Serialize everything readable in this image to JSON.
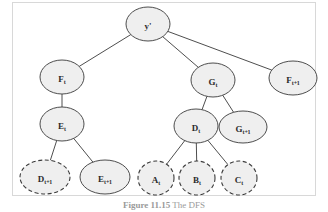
{
  "figure": {
    "caption_label": "Figure",
    "caption_number": "11.15",
    "caption_text": "The DFS",
    "frame_color": "#d8d8d8",
    "node_fill": "#efefef",
    "node_stroke": "#3a3a3a",
    "edge_color": "#3a3a3a"
  },
  "chart_data": {
    "type": "diagram",
    "nodes": [
      {
        "id": "root",
        "main": "y",
        "prime": "'",
        "sub": "",
        "cx": 148,
        "cy": 24,
        "rx": 22,
        "ry": 17,
        "dashed": false
      },
      {
        "id": "Ft",
        "main": "F",
        "prime": "",
        "sub": "t",
        "cx": 62,
        "cy": 77,
        "rx": 22,
        "ry": 17,
        "dashed": false
      },
      {
        "id": "Gt",
        "main": "G",
        "prime": "",
        "sub": "t",
        "cx": 213,
        "cy": 80,
        "rx": 22,
        "ry": 17,
        "dashed": false
      },
      {
        "id": "Ft1",
        "main": "F",
        "prime": "",
        "sub": "t+1",
        "cx": 293,
        "cy": 78,
        "rx": 24,
        "ry": 17,
        "dashed": false
      },
      {
        "id": "Et",
        "main": "E",
        "prime": "",
        "sub": "t",
        "cx": 62,
        "cy": 124,
        "rx": 22,
        "ry": 17,
        "dashed": false
      },
      {
        "id": "Dt",
        "main": "D",
        "prime": "",
        "sub": "t",
        "cx": 196,
        "cy": 126,
        "rx": 22,
        "ry": 17,
        "dashed": false
      },
      {
        "id": "Gt1",
        "main": "G",
        "prime": "",
        "sub": "t+1",
        "cx": 243,
        "cy": 127,
        "rx": 24,
        "ry": 16,
        "dashed": false
      },
      {
        "id": "Dt1",
        "main": "D",
        "prime": "",
        "sub": "t+1",
        "cx": 45,
        "cy": 177,
        "rx": 25,
        "ry": 17,
        "dashed": true
      },
      {
        "id": "Et1",
        "main": "E",
        "prime": "",
        "sub": "t+1",
        "cx": 105,
        "cy": 177,
        "rx": 25,
        "ry": 17,
        "dashed": false
      },
      {
        "id": "At",
        "main": "A",
        "prime": "",
        "sub": "t",
        "cx": 156,
        "cy": 178,
        "rx": 18,
        "ry": 17,
        "dashed": true
      },
      {
        "id": "Bt",
        "main": "B",
        "prime": "",
        "sub": "t",
        "cx": 197,
        "cy": 178,
        "rx": 18,
        "ry": 17,
        "dashed": true
      },
      {
        "id": "Ct",
        "main": "C",
        "prime": "",
        "sub": "t",
        "cx": 239,
        "cy": 178,
        "rx": 18,
        "ry": 17,
        "dashed": true
      }
    ],
    "edges": [
      {
        "from": "root",
        "to": "Ft"
      },
      {
        "from": "root",
        "to": "Gt"
      },
      {
        "from": "root",
        "to": "Ft1"
      },
      {
        "from": "Ft",
        "to": "Et"
      },
      {
        "from": "Gt",
        "to": "Dt"
      },
      {
        "from": "Gt",
        "to": "Gt1"
      },
      {
        "from": "Et",
        "to": "Dt1"
      },
      {
        "from": "Et",
        "to": "Et1"
      },
      {
        "from": "Dt",
        "to": "At"
      },
      {
        "from": "Dt",
        "to": "Bt"
      },
      {
        "from": "Dt",
        "to": "Ct"
      }
    ]
  }
}
